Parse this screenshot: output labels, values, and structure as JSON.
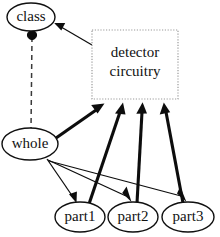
{
  "diagram": {
    "background_color": "#ffffff",
    "stroke_color": "#0d0d0d",
    "box_border_color": "#9a9a9a",
    "nodes": [
      {
        "id": "class",
        "label": "class",
        "shape": "ellipse",
        "cx": 31,
        "cy": 17,
        "rx": 24,
        "ry": 14
      },
      {
        "id": "whole",
        "label": "whole",
        "shape": "ellipse",
        "cx": 30,
        "cy": 144,
        "rx": 28,
        "ry": 16
      },
      {
        "id": "part1",
        "label": "part1",
        "shape": "ellipse",
        "cx": 80,
        "cy": 217,
        "rx": 25,
        "ry": 15
      },
      {
        "id": "part2",
        "label": "part2",
        "shape": "ellipse",
        "cx": 133,
        "cy": 217,
        "rx": 25,
        "ry": 15
      },
      {
        "id": "part3",
        "label": "part3",
        "shape": "ellipse",
        "cx": 188,
        "cy": 217,
        "rx": 26,
        "ry": 15
      },
      {
        "id": "detector",
        "label_line1": "detector",
        "label_line2": "circuitry",
        "shape": "dotted-box",
        "x": 92,
        "y": 30,
        "width": 86,
        "height": 69
      }
    ],
    "edges": [
      {
        "from": "detector",
        "to": "class",
        "style": "solid-thin",
        "arrow": true
      },
      {
        "from": "class",
        "to": "whole",
        "style": "dashed",
        "arrow": false,
        "source_decoration": "filled-ball"
      },
      {
        "from": "whole",
        "to": "detector",
        "style": "solid-thick",
        "arrow": true
      },
      {
        "from": "part1",
        "to": "detector",
        "style": "solid-thick",
        "arrow": true
      },
      {
        "from": "part2",
        "to": "detector",
        "style": "solid-thick",
        "arrow": true
      },
      {
        "from": "part3",
        "to": "detector",
        "style": "solid-thick",
        "arrow": true
      },
      {
        "from": "whole",
        "to": "part1",
        "style": "solid-thin",
        "arrow": true
      },
      {
        "from": "whole",
        "to": "part2",
        "style": "solid-thin",
        "arrow": true
      },
      {
        "from": "whole",
        "to": "part3",
        "style": "solid-thin",
        "arrow": true
      }
    ]
  }
}
